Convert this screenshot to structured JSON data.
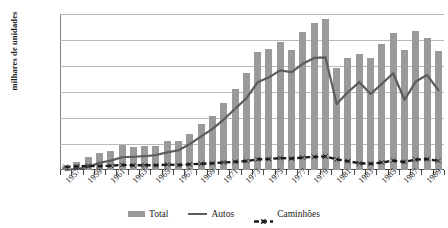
{
  "chart_data": {
    "type": "bar",
    "title": "",
    "xlabel": "",
    "ylabel": "milhares de unidades",
    "ylim": [
      0,
      1200
    ],
    "ytick_values": [
      0,
      200,
      400,
      600,
      800,
      1000,
      1200
    ],
    "ytick_labels": [
      "-",
      "200,",
      "400,",
      "600,",
      "800,",
      "1000,",
      "1200,"
    ],
    "grid": true,
    "legend_position": "bottom",
    "x": [
      1957,
      1958,
      1959,
      1960,
      1961,
      1962,
      1963,
      1964,
      1965,
      1966,
      1967,
      1968,
      1969,
      1970,
      1971,
      1972,
      1973,
      1974,
      1975,
      1976,
      1977,
      1978,
      1979,
      1980,
      1981,
      1982,
      1983,
      1984,
      1985,
      1986,
      1987,
      1988,
      1989,
      1990
    ],
    "xtick_labels": [
      "1957",
      "1959",
      "1961",
      "1963",
      "1965",
      "1967",
      "1969",
      "1971",
      "1973",
      "1975",
      "1977",
      "1979",
      "1981",
      "1983",
      "1985",
      "1987",
      "1989"
    ],
    "series": [
      {
        "name": "Total",
        "kind": "bar",
        "color": "#9a9a9a",
        "values": [
          31,
          61,
          98,
          133,
          146,
          191,
          174,
          184,
          185,
          225,
          226,
          280,
          354,
          416,
          517,
          622,
          750,
          906,
          930,
          986,
          921,
          1064,
          1128,
          1165,
          781,
          859,
          896,
          865,
          967,
          1056,
          920,
          1069,
          1013,
          915
        ]
      },
      {
        "name": "Autos",
        "kind": "line",
        "color": "#5c5c5c",
        "values": [
          0,
          8,
          23,
          56,
          72,
          98,
          102,
          106,
          115,
          136,
          152,
          200,
          258,
          316,
          388,
          471,
          551,
          675,
          713,
          766,
          752,
          817,
          862,
          867,
          507,
          600,
          676,
          585,
          663,
          744,
          540,
          681,
          731,
          615
        ]
      },
      {
        "name": "Caminhões",
        "kind": "dashed-line",
        "color": "#1a1a1a",
        "marker": "x",
        "values": [
          25,
          28,
          32,
          30,
          33,
          39,
          36,
          37,
          36,
          42,
          38,
          44,
          48,
          52,
          58,
          63,
          69,
          82,
          85,
          92,
          88,
          96,
          101,
          104,
          82,
          68,
          52,
          48,
          58,
          72,
          62,
          80,
          84,
          70
        ]
      }
    ]
  },
  "legend": {
    "items": [
      {
        "label": "Total",
        "swatch": "bar-swatch-icon"
      },
      {
        "label": "Autos",
        "swatch": "line-swatch-icon"
      },
      {
        "label": "Caminhões",
        "swatch": "dashed-line-swatch-icon"
      }
    ]
  },
  "colors": {
    "bar": "#9a9a9a",
    "autos_line": "#5c5c5c",
    "caminhoes_line": "#1a1a1a",
    "grid": "#b9b9b9",
    "axis": "#4a4a4a",
    "background": "#ffffff"
  }
}
